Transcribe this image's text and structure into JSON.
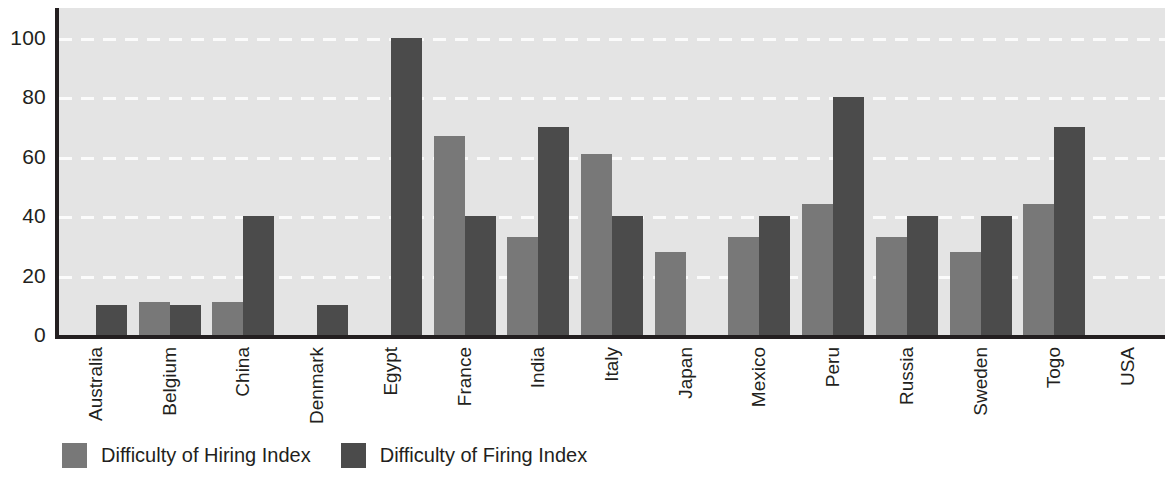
{
  "chart_data": {
    "type": "bar",
    "title": "",
    "xlabel": "",
    "ylabel": "",
    "ylim": [
      0,
      110
    ],
    "yticks": [
      0,
      20,
      40,
      60,
      80,
      100
    ],
    "grid": true,
    "legend_position": "bottom-left",
    "categories": [
      "Australia",
      "Belgium",
      "China",
      "Denmark",
      "Egypt",
      "France",
      "India",
      "Italy",
      "Japan",
      "Mexico",
      "Peru",
      "Russia",
      "Sweden",
      "Togo",
      "USA"
    ],
    "series": [
      {
        "name": "Difficulty of Hiring Index",
        "color": "#787878",
        "values": [
          0,
          11,
          11,
          0,
          0,
          67,
          33,
          61,
          28,
          33,
          44,
          33,
          28,
          44,
          0
        ]
      },
      {
        "name": "Difficulty of Firing Index",
        "color": "#4b4b4b",
        "values": [
          10,
          10,
          40,
          10,
          100,
          40,
          70,
          40,
          0,
          40,
          80,
          40,
          40,
          70,
          0
        ]
      }
    ]
  },
  "legend": {
    "items": [
      {
        "label": "Difficulty of Hiring Index",
        "swatch": "hire"
      },
      {
        "label": "Difficulty of Firing Index",
        "swatch": "fire"
      }
    ]
  },
  "colors": {
    "plot_background": "#e4e4e4",
    "axis": "#231f20",
    "gridline": "#fbfbfb",
    "series_hiring": "#787878",
    "series_firing": "#4b4b4b"
  }
}
